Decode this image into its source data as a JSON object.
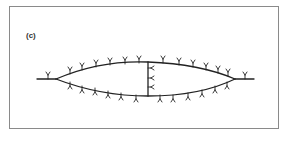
{
  "figure": {
    "panel_label": "(c)",
    "colors": {
      "frame_border": "#8a8a8a",
      "stroke": "#222222",
      "background": "#ffffff"
    },
    "markers": {
      "glyph": "Y",
      "top_curve_count": 15,
      "bottom_curve_count": 14,
      "center_bridge_count": 3,
      "left_tail_count": 1,
      "right_tail_count": 1
    }
  }
}
